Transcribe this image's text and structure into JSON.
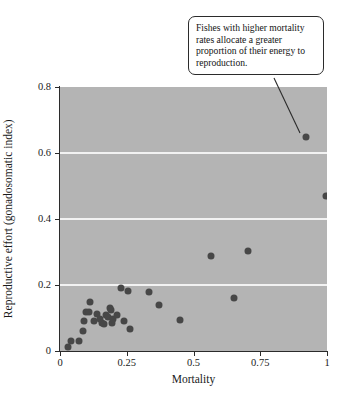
{
  "chart_data": {
    "type": "scatter",
    "title": "",
    "xlabel": "Mortality",
    "ylabel": "Reproductive effort (gonadosomatic index)",
    "xlim": [
      0,
      1
    ],
    "ylim": [
      0,
      0.8
    ],
    "xticks": [
      "0",
      "0.25",
      "0.5",
      "0.75",
      "1"
    ],
    "xtick_values": [
      0,
      0.25,
      0.5,
      0.75,
      1
    ],
    "yticks": [
      "0",
      "0.2",
      "0.4",
      "0.6",
      "0.8"
    ],
    "ytick_values": [
      0,
      0.2,
      0.4,
      0.6,
      0.8
    ],
    "grid": "horizontal-white-gridlines-at-0.2-0.4-0.6",
    "gridline_values": [
      0.2,
      0.4,
      0.6
    ],
    "legend": "none",
    "plot_background_color": "#b4b4b4",
    "point_color": "#474747",
    "points": [
      {
        "x": 0.03,
        "y": 0.013
      },
      {
        "x": 0.04,
        "y": 0.031
      },
      {
        "x": 0.07,
        "y": 0.03
      },
      {
        "x": 0.088,
        "y": 0.062
      },
      {
        "x": 0.09,
        "y": 0.092
      },
      {
        "x": 0.098,
        "y": 0.118
      },
      {
        "x": 0.108,
        "y": 0.119
      },
      {
        "x": 0.112,
        "y": 0.148
      },
      {
        "x": 0.128,
        "y": 0.092
      },
      {
        "x": 0.138,
        "y": 0.112
      },
      {
        "x": 0.15,
        "y": 0.098
      },
      {
        "x": 0.158,
        "y": 0.085
      },
      {
        "x": 0.165,
        "y": 0.082
      },
      {
        "x": 0.172,
        "y": 0.108
      },
      {
        "x": 0.178,
        "y": 0.102
      },
      {
        "x": 0.188,
        "y": 0.129
      },
      {
        "x": 0.192,
        "y": 0.124
      },
      {
        "x": 0.196,
        "y": 0.085
      },
      {
        "x": 0.2,
        "y": 0.098
      },
      {
        "x": 0.215,
        "y": 0.108
      },
      {
        "x": 0.228,
        "y": 0.192
      },
      {
        "x": 0.24,
        "y": 0.09
      },
      {
        "x": 0.255,
        "y": 0.182
      },
      {
        "x": 0.262,
        "y": 0.066
      },
      {
        "x": 0.335,
        "y": 0.18
      },
      {
        "x": 0.37,
        "y": 0.138
      },
      {
        "x": 0.448,
        "y": 0.095
      },
      {
        "x": 0.565,
        "y": 0.288
      },
      {
        "x": 0.65,
        "y": 0.162
      },
      {
        "x": 0.705,
        "y": 0.302
      },
      {
        "x": 0.92,
        "y": 0.65
      },
      {
        "x": 0.995,
        "y": 0.47
      }
    ],
    "annotations": [
      {
        "text": "Fishes with higher mortality rates allocate a greater proportion of their energy to reproduction.",
        "points_to": {
          "x": 0.92,
          "y": 0.65
        }
      }
    ]
  }
}
